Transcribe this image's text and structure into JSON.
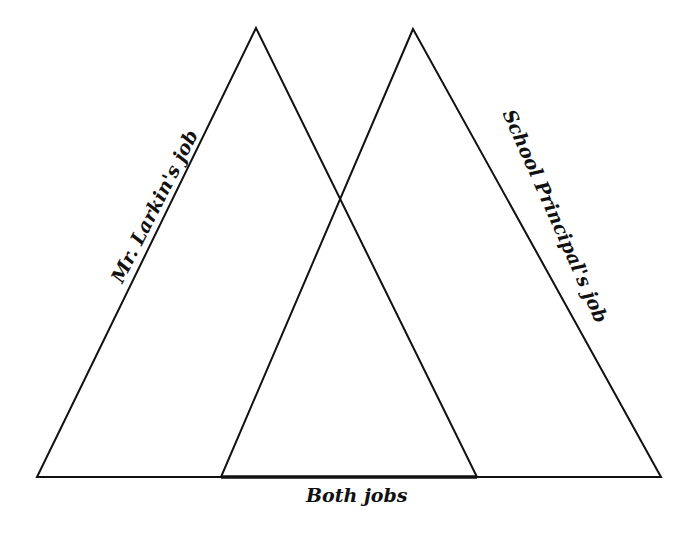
{
  "diagram": {
    "type": "overlapping-triangles-venn",
    "labels": {
      "left": "Mr. Larkin's job",
      "right": "School Principal's job",
      "overlap": "Both jobs"
    },
    "colors": {
      "line": "#111111",
      "background": "#ffffff"
    }
  }
}
